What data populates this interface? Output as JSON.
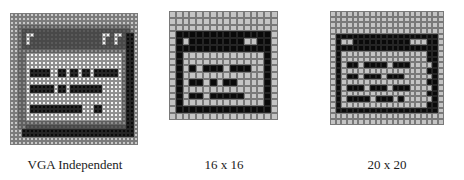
{
  "figure": {
    "panels": [
      {
        "id": "vga",
        "caption": "VGA Independent",
        "grid": {
          "cols": 32,
          "rows": 33,
          "x": 10,
          "y": 13,
          "cell": 4
        },
        "colors": {
          "g": "#c8c8c8",
          "d": "#5a5a5a",
          "m": "#8c8c8c",
          "k": "#0a0a0a",
          "w": "#f4f4f4"
        },
        "rows": [
          "gggggggggggggggggggggggggggggggg",
          "gggggggggggggggggggggggggggggggg",
          "gggggggggggggggggggggggggggggggg",
          "ggmmmmmmmmmmmmmmmmmmmmmmmmmmmmgg",
          "ggmdddddddddddddddddddddddddddmg",
          "ggmdwwdddddddddddddddddwwdwwdkkg",
          "ggmdwddddddddddddddddddwddwddkkg",
          "ggmdwddddddddddddddddddwddwddkkg",
          "ggmddddddddddddddddddddddddddkkg",
          "ggmmmmmmmmmmmmmmmmmmmmmmmmmmmkkg",
          "ggmmwwwwwwwwwwwwwwwwwwwwwwwwmkkg",
          "ggmmwwwwwwwwwwwwwwwwwwwwwwwwmkkg",
          "ggmmwwwwwwwwwwwwwwwwwwwwwwwwmkkg",
          "ggmmwwwwwwwwwwwwwwwwwwwwwwwwmkkg",
          "ggmmwkkkkkwwkkwkkwkkwkkkkkkwmkkg",
          "ggmmwkkkkkwwkkwkkwkkwkkkkkkwmkkg",
          "ggmmwwwwwwwwwwwwwwwwwwwwwwwwmkkg",
          "ggmmwwwwwwwwwwwwwwwwwwwwwwwwmkkg",
          "ggmmwkkkkkkwkkwkkkkkkkkwwwwwmkkg",
          "ggmmwkkkkkkwkkwkkkkkkkkwwwwwmkkg",
          "ggmmwwwwwwwwwwwwwwwwwwwwwwwwmkkg",
          "ggmmwwwwwwwwwwwwwwwwwwwwwwwwmkkg",
          "ggmmwwwwwwwwwwwwwwwwwwwwwwwwmkkg",
          "ggmmwkkkkkkkkkkkkkwwwkkwwwwwmkkg",
          "ggmmwkkkkkkkkkkkkkwwwkkwwwwwmkkg",
          "ggmmwwwwwwwwwwwwwwwwwwwwwwwwmkkg",
          "ggmmwwwwwwwwwwwwwwwwwwwwwwwwmkkg",
          "ggmmmmmmmmmmmmmmmmmmmmmmmmmmmkkg",
          "ggmmdddddddddddddddddddddddddkkg",
          "gggkkkkkkkkkkkkkkkkkkkkkkkkkkkkg",
          "gggkkkkkkkkkkkkkkkkkkkkkkkkkkkkg",
          "gggggggggggggggggggggggggggggggg",
          "gggggggggggggggggggggggggggggggg"
        ]
      },
      {
        "id": "16x16",
        "caption": "16 x 16",
        "grid": {
          "cols": 16,
          "rows": 16,
          "x": 169,
          "y": 11,
          "cell": 6.8
        },
        "colors": {
          "g": "#c4c4c4",
          "k": "#0a0a0a"
        },
        "rows": [
          "gggggggggggggggg",
          "gggggggggggggggg",
          "gggggggggggggggg",
          "gkkkkkkkkkkkkkkg",
          "gkgkkkkkkkkggkkg",
          "gkkkkkkkkkkkkkkg",
          "gkggggggggggggkg",
          "gkggggggggggggkg",
          "gkgkgkkkgkkkggkg",
          "gkggggggggggggkg",
          "gkgkkgkgkkggggkg",
          "gkggggggggggggkg",
          "gkgkkgkkkkkgggkg",
          "gkggggggggggggkg",
          "gkkkkkkkkkkkkkkg",
          "gggggggggggggggg"
        ]
      },
      {
        "id": "20x20",
        "caption": "20 x 20",
        "grid": {
          "cols": 20,
          "rows": 20,
          "x": 330,
          "y": 11,
          "cell": 5.7
        },
        "colors": {
          "g": "#c4c4c4",
          "k": "#0a0a0a"
        },
        "rows": [
          "gggggggggggggggggggg",
          "gggggggggggggggggggg",
          "gggggggggggggggggggg",
          "gggggggggggggggggggg",
          "gkkkkkkkkkkkkkkkkkkg",
          "gkggkkkkkkkkkkgggkkg",
          "gkkkkkkkkkkkkkkkkkkg",
          "gkgggggggggggggggkkg",
          "gkgggggggggggggggkkg",
          "gkgkkgkkkkgkkkggggkg",
          "gkgggggggggggggggkkg",
          "gkgkkgkkkgkkkgggggkg",
          "gkgggggggggggggggkkg",
          "gkgkkkgkkkgkkkggggkg",
          "gkgggggggggggggggkkg",
          "gkgkkkkgkkkgkgggggkg",
          "gkgggggggggggggggkkg",
          "gkkkkkkkkkkkkkkkkkkg",
          "gggggggggggggggggggg",
          "gggggggggggggggggggg"
        ]
      }
    ],
    "captions_y": 157
  }
}
